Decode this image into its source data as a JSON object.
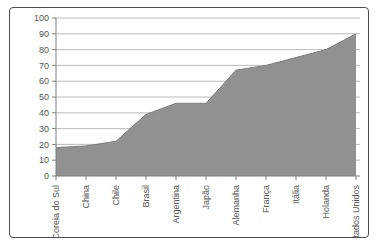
{
  "figure": {
    "background": "#ffffff",
    "frame_border_color": "#4d4d4d"
  },
  "chart_data": {
    "type": "area",
    "title": "",
    "xlabel": "",
    "ylabel": "",
    "categories": [
      "Coreia do Sul",
      "China",
      "Chile",
      "Brasil",
      "Argentina",
      "Japão",
      "Alemanha",
      "França",
      "Itália",
      "Holanda",
      "Estados Unidos"
    ],
    "values": [
      18,
      19,
      22,
      39,
      46,
      46,
      67,
      70,
      75,
      80,
      90
    ],
    "ylim": [
      0,
      100
    ],
    "y_ticks": [
      0,
      10,
      20,
      30,
      40,
      50,
      60,
      70,
      80,
      90,
      100
    ],
    "grid": true,
    "legend": "none",
    "x_label_rotation_deg": -90,
    "colors": {
      "area_fill": "#919191",
      "area_edge": "#7d7d7d",
      "gridline": "#a9a9a9",
      "axis_line": "#7f7f7f",
      "tick_label": "#565656"
    }
  }
}
